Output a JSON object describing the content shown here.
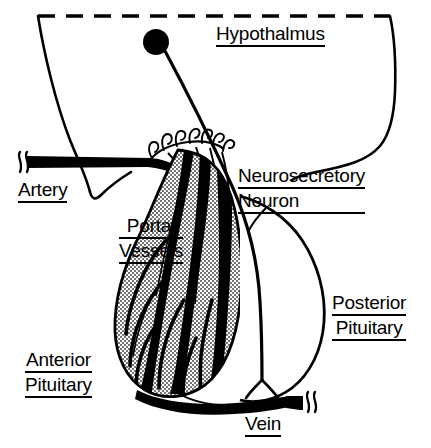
{
  "figure": {
    "title_text_present": false,
    "width": 431,
    "height": 448,
    "background_color": "#ffffff",
    "ink_color": "#000000",
    "anterior_pituitary_fill": "#c8c8c8"
  },
  "labels": {
    "hypothalmus": {
      "lines": [
        "Hypothalmus"
      ]
    },
    "neurosecretory_neuron": {
      "lines": [
        "Neurosecretory",
        "Neuron"
      ]
    },
    "artery": {
      "lines": [
        "Artery"
      ]
    },
    "portal_vessels": {
      "lines": [
        "Portal",
        "Vessels"
      ]
    },
    "posterior_pituitary": {
      "lines": [
        "Posterior",
        "Pituitary"
      ]
    },
    "anterior_pituitary": {
      "lines": [
        "Anterior",
        "Pituitary"
      ]
    },
    "vein": {
      "lines": [
        "Vein"
      ]
    }
  },
  "structures": {
    "hypothalamus_boundary": "dashed-top-with-curved-sides",
    "neuron_cell_body": "filled-black-circle",
    "capillary_loop_count": 7,
    "artery_break_mark": "double-squiggle",
    "vein_break_mark": "double-squiggle",
    "anterior_pituitary_texture": "stippled",
    "posterior_pituitary_texture": "unfilled-white"
  }
}
